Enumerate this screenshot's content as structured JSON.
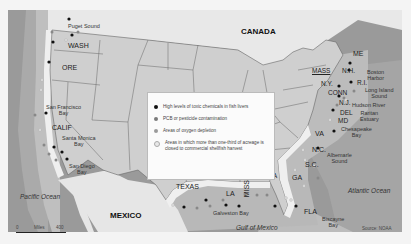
{
  "map": {
    "countries": [
      "CANADA",
      "MEXICO"
    ],
    "oceans": [
      "Pacific Ocean",
      "Atlantic Ocean",
      "Gulf of Mexico"
    ],
    "states": [
      "WASH",
      "ORE",
      "CALIF",
      "TEXAS",
      "LA",
      "MISS",
      "ALA",
      "GA",
      "FLA",
      "S.C.",
      "N.C.",
      "VA",
      "MD",
      "DEL",
      "N.J.",
      "CONN",
      "R.I.",
      "N.Y.",
      "MASS",
      "N.H.",
      "ME"
    ],
    "water_bodies": [
      "Puget Sound",
      "San Francisco Bay",
      "Santa Monica Bay",
      "San Diego Bay",
      "Galveston Bay",
      "Biscayne Bay",
      "Albemarle Sound",
      "Chesapeake Bay",
      "Raritan Estuary",
      "Hudson River",
      "Long Island Sound",
      "Boston Harbor"
    ],
    "labels": {
      "canada": "CANADA",
      "mexico": "MEXICO",
      "pacific": "Pacific Ocean",
      "atlantic": "Atlantic Ocean",
      "gulf": "Gulf of Mexico",
      "wash": "WASH",
      "ore": "ORE",
      "calif": "CALIF",
      "texas": "TEXAS",
      "la": "LA",
      "miss": "MISS",
      "ala": "ALA",
      "ga": "GA",
      "fla": "FLA",
      "sc": "S.C.",
      "nc": "N.C.",
      "va": "VA",
      "md": "MD",
      "del": "DEL",
      "nj": "N.J.",
      "conn": "CONN",
      "ri": "R.I.",
      "ny": "N.Y.",
      "mass": "MASS",
      "nh": "N.H.",
      "me": "ME",
      "puget": "Puget Sound",
      "sf_1": "San Francisco",
      "sf_2": "Bay",
      "santa_monica_1": "Santa Monica",
      "santa_monica_2": "Bay",
      "san_diego_1": "San Diego",
      "san_diego_2": "Bay",
      "galveston": "Galveston Bay",
      "biscayne_1": "Biscayne",
      "biscayne_2": "Bay",
      "albemarle_1": "Albemarle",
      "albemarle_2": "Sound",
      "chesapeake_1": "Chesapeake",
      "chesapeake_2": "Bay",
      "raritan_1": "Raritan",
      "raritan_2": "Estuary",
      "hudson": "Hudson River",
      "long_island_1": "Long Island",
      "long_island_2": "Sound",
      "boston_1": "Boston",
      "boston_2": "Harbor"
    },
    "colors": {
      "land": "#cfcfcf",
      "land_other": "#e6e6e6",
      "shelf": "#bdbdbd",
      "ocean_mid": "#a9a9a9",
      "ocean_deep": "#8e8e8e",
      "coast_band": "#ebebeb",
      "border": "#555555"
    }
  },
  "legend": {
    "items": [
      {
        "label": "High levels of toxic chemicals in fish livers",
        "color": "#111111"
      },
      {
        "label": "PCB or pesticide contamination",
        "color": "#7a7a7a"
      },
      {
        "label": "Areas of oxygen depletion",
        "color": "#9a9a9a"
      },
      {
        "label": "Areas in which more than one-third of acreage is closed to commercial shellfish harvest",
        "color": "#e8e8e8"
      }
    ]
  },
  "scale": {
    "start": "0",
    "unit": "Miles",
    "end": "400"
  },
  "source": "Source: NOAA"
}
